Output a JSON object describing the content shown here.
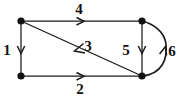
{
  "figure": {
    "type": "directed-graph",
    "background_color": "#ffffff",
    "ink_color": "#111111",
    "width": 180,
    "height": 99
  },
  "vertices": [
    {
      "id": "top-left",
      "name": "vertex-top-left",
      "x": 21,
      "y": 21
    },
    {
      "id": "top-right",
      "name": "vertex-top-right",
      "x": 142,
      "y": 21
    },
    {
      "id": "bottom-left",
      "name": "vertex-bottom-left",
      "x": 21,
      "y": 76
    },
    {
      "id": "bottom-right",
      "name": "vertex-bottom-right",
      "x": 142,
      "y": 76
    }
  ],
  "edges": [
    {
      "label": "1",
      "name": "edge-1-left-side",
      "from": "top-left",
      "to": "bottom-left",
      "shape": "straight",
      "direction": "down",
      "label_x": 7,
      "label_y": 50
    },
    {
      "label": "2",
      "name": "edge-2-bottom-side",
      "from": "bottom-left",
      "to": "bottom-right",
      "shape": "straight",
      "direction": "right",
      "label_x": 80,
      "label_y": 89
    },
    {
      "label": "3",
      "name": "edge-3-diagonal",
      "from": "bottom-right",
      "to": "top-left",
      "shape": "straight",
      "direction": "up-left",
      "label_x": 88,
      "label_y": 46
    },
    {
      "label": "4",
      "name": "edge-4-top-side",
      "from": "top-left",
      "to": "top-right",
      "shape": "straight",
      "direction": "right",
      "label_x": 79,
      "label_y": 9
    },
    {
      "label": "5",
      "name": "edge-5-right-side",
      "from": "top-right",
      "to": "bottom-right",
      "shape": "straight",
      "direction": "down",
      "label_x": 126,
      "label_y": 50
    },
    {
      "label": "6",
      "name": "edge-6-right-arc",
      "from": "bottom-right",
      "to": "top-right",
      "shape": "curved-arc-right",
      "direction": "up",
      "label_x": 172,
      "label_y": 51
    }
  ]
}
